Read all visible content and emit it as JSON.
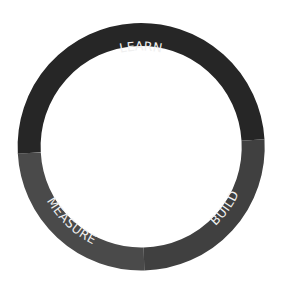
{
  "diagram": {
    "type": "cycle-ring",
    "segments": [
      {
        "label": "LEARN",
        "color": "#262626",
        "position": "top"
      },
      {
        "label": "BUILD",
        "color": "#404040",
        "position": "bottom-right"
      },
      {
        "label": "MEASURE",
        "color": "#4a4a4a",
        "position": "bottom-left"
      }
    ]
  }
}
